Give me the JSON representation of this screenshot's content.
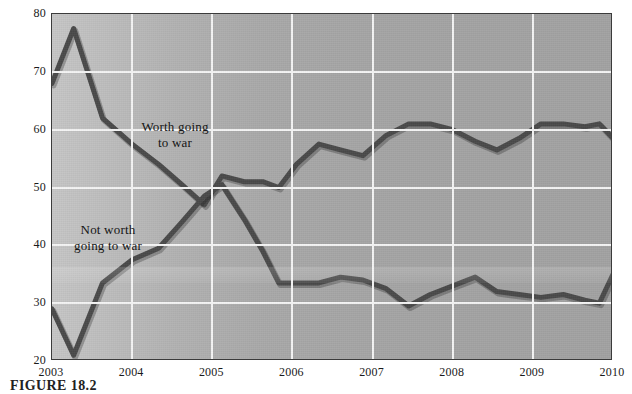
{
  "figure": {
    "caption": "FIGURE 18.2",
    "axis_y_title": "Percent"
  },
  "chart_data": {
    "type": "line",
    "title": "",
    "xlabel": "",
    "ylabel": "Percent",
    "xlim": [
      2003.0,
      2010.0
    ],
    "ylim": [
      20,
      80
    ],
    "yticks": [
      20,
      30,
      40,
      50,
      60,
      70,
      80
    ],
    "xticks": [
      2003,
      2004,
      2005,
      2006,
      2007,
      2008,
      2009,
      2010
    ],
    "xtick_labels": [
      "2003",
      "2004",
      "2005",
      "2006",
      "2007",
      "2008",
      "2009",
      "2010"
    ],
    "ytick_labels": [
      "20",
      "30",
      "40",
      "50",
      "60",
      "70",
      "80"
    ],
    "grid": true,
    "grid_color": "#f4f4f4",
    "panel_color": "#a8a8a8",
    "line_color": "#4a4a4a",
    "legend": "annotations-inline",
    "annotations": [
      {
        "text": "Worth going\nto war",
        "x": 2004.0,
        "y": 59.0
      },
      {
        "text": "Not worth\ngoing to war",
        "x": 2003.2,
        "y": 41.5
      }
    ],
    "series": [
      {
        "name": "Worth going to war",
        "x": [
          2003.0,
          2003.27,
          2003.63,
          2004.0,
          2004.33,
          2004.62,
          2004.9,
          2005.12,
          2005.4,
          2005.63,
          2005.83,
          2006.05,
          2006.33,
          2006.6,
          2006.88,
          2007.17,
          2007.45,
          2007.72,
          2008.0,
          2008.28,
          2008.55,
          2008.83,
          2009.1,
          2009.38,
          2009.65,
          2009.83,
          2010.0
        ],
        "y": [
          68.0,
          77.5,
          62.0,
          57.5,
          54.0,
          50.5,
          47.0,
          52.0,
          51.0,
          51.0,
          50.0,
          54.0,
          57.5,
          56.5,
          55.5,
          59.0,
          61.0,
          61.0,
          60.0,
          58.0,
          56.5,
          58.5,
          61.0,
          61.0,
          60.5,
          61.0,
          58.5
        ]
      },
      {
        "name": "Not worth going to war",
        "x": [
          2003.0,
          2003.27,
          2003.63,
          2004.0,
          2004.33,
          2004.62,
          2004.9,
          2005.12,
          2005.4,
          2005.63,
          2005.83,
          2006.05,
          2006.33,
          2006.6,
          2006.88,
          2007.17,
          2007.45,
          2007.72,
          2008.0,
          2008.28,
          2008.55,
          2008.83,
          2009.1,
          2009.38,
          2009.65,
          2009.83,
          2010.0
        ],
        "y": [
          29.0,
          21.0,
          33.5,
          37.5,
          39.5,
          44.0,
          48.5,
          50.5,
          44.5,
          39.0,
          33.5,
          33.5,
          33.5,
          34.5,
          34.0,
          32.5,
          29.5,
          31.5,
          33.0,
          34.5,
          32.0,
          31.5,
          31.0,
          31.5,
          30.5,
          30.0,
          35.0
        ]
      }
    ]
  }
}
